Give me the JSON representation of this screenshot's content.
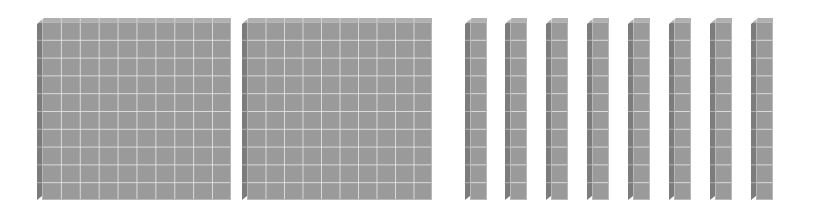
{
  "diagram": {
    "title": "",
    "colors": {
      "face": "#9a9a9a",
      "side": "#7c7c7c",
      "top": "#b0b0b0",
      "gridline": "#e6e6e6",
      "background": "#ffffff"
    },
    "flats": [
      {
        "label": "hundred-flat-1",
        "value": 100,
        "rows": 10,
        "cols": 10,
        "x": 42,
        "y": 22,
        "w": 189,
        "h": 178
      },
      {
        "label": "hundred-flat-2",
        "value": 100,
        "rows": 10,
        "cols": 10,
        "x": 247,
        "y": 22,
        "w": 185,
        "h": 178
      }
    ],
    "rods": [
      {
        "label": "ten-rod-1",
        "value": 10,
        "x": 470,
        "y": 22,
        "w": 17,
        "h": 178
      },
      {
        "label": "ten-rod-2",
        "value": 10,
        "x": 510,
        "y": 22,
        "w": 17,
        "h": 178
      },
      {
        "label": "ten-rod-3",
        "value": 10,
        "x": 551,
        "y": 22,
        "w": 17,
        "h": 178
      },
      {
        "label": "ten-rod-4",
        "value": 10,
        "x": 592,
        "y": 22,
        "w": 17,
        "h": 178
      },
      {
        "label": "ten-rod-5",
        "value": 10,
        "x": 633,
        "y": 22,
        "w": 17,
        "h": 178
      },
      {
        "label": "ten-rod-6",
        "value": 10,
        "x": 674,
        "y": 22,
        "w": 17,
        "h": 178
      },
      {
        "label": "ten-rod-7",
        "value": 10,
        "x": 715,
        "y": 22,
        "w": 17,
        "h": 178
      },
      {
        "label": "ten-rod-8",
        "value": 10,
        "x": 756,
        "y": 22,
        "w": 17,
        "h": 178
      }
    ],
    "total_value": 280
  }
}
